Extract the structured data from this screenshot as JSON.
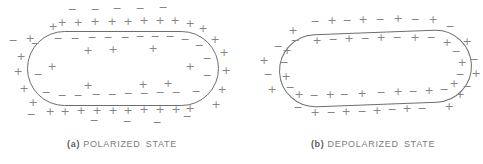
{
  "canvas": {
    "width": 483,
    "height": 164,
    "background": "#ffffff"
  },
  "colors": {
    "membrane": "#6e6e6e",
    "charge": "#858585",
    "caption": "#7c7c7c",
    "caption_prefix": "#5f5f5f"
  },
  "figures": [
    {
      "name": "polarized-cell",
      "caption_prefix": "(a)",
      "caption_text": "POLARIZED STATE",
      "caption_center_x": 122,
      "caption_top": 139,
      "stadium": {
        "left": 27,
        "top": 31,
        "width": 192,
        "height": 75,
        "radius": 37.5,
        "rotate_deg": 0
      },
      "charges": [
        [
          72,
          10,
          "-"
        ],
        [
          95,
          10,
          "-"
        ],
        [
          117,
          9,
          "-"
        ],
        [
          140,
          9,
          "-"
        ],
        [
          163,
          8,
          "-"
        ],
        [
          13,
          41,
          "-"
        ],
        [
          31,
          115,
          "-"
        ],
        [
          94,
          121,
          "-"
        ],
        [
          127,
          122,
          "-"
        ],
        [
          157,
          123,
          "-"
        ],
        [
          187,
          117,
          "-"
        ],
        [
          53,
          27,
          "+"
        ],
        [
          62,
          23,
          "+"
        ],
        [
          78,
          23,
          "+"
        ],
        [
          95,
          22,
          "+"
        ],
        [
          112,
          22,
          "+"
        ],
        [
          128,
          22,
          "+"
        ],
        [
          144,
          21,
          "+"
        ],
        [
          160,
          21,
          "+"
        ],
        [
          175,
          21,
          "+"
        ],
        [
          190,
          24,
          "+"
        ],
        [
          203,
          29,
          "+"
        ],
        [
          215,
          40,
          "+"
        ],
        [
          224,
          53,
          "+"
        ],
        [
          226,
          71,
          "+"
        ],
        [
          222,
          90,
          "+"
        ],
        [
          216,
          105,
          "+"
        ],
        [
          190,
          109,
          "+"
        ],
        [
          176,
          110,
          "+"
        ],
        [
          160,
          110,
          "+"
        ],
        [
          144,
          110,
          "+"
        ],
        [
          128,
          111,
          "+"
        ],
        [
          113,
          111,
          "+"
        ],
        [
          97,
          111,
          "+"
        ],
        [
          81,
          111,
          "+"
        ],
        [
          65,
          112,
          "+"
        ],
        [
          50,
          112,
          "+"
        ],
        [
          33,
          103,
          "+"
        ],
        [
          24,
          89,
          "+"
        ],
        [
          18,
          72,
          "+"
        ],
        [
          21,
          57,
          "+"
        ],
        [
          30,
          39,
          "+"
        ],
        [
          58,
          39,
          "-"
        ],
        [
          75,
          39,
          "-"
        ],
        [
          92,
          38,
          "-"
        ],
        [
          108,
          38,
          "-"
        ],
        [
          125,
          38,
          "-"
        ],
        [
          140,
          37,
          "-"
        ],
        [
          155,
          37,
          "-"
        ],
        [
          170,
          37,
          "-"
        ],
        [
          185,
          40,
          "-"
        ],
        [
          199,
          46,
          "-"
        ],
        [
          207,
          59,
          "-"
        ],
        [
          207,
          76,
          "-"
        ],
        [
          196,
          92,
          "-"
        ],
        [
          176,
          93,
          "-"
        ],
        [
          160,
          93,
          "-"
        ],
        [
          144,
          94,
          "-"
        ],
        [
          128,
          94,
          "-"
        ],
        [
          112,
          95,
          "-"
        ],
        [
          96,
          95,
          "-"
        ],
        [
          78,
          96,
          "-"
        ],
        [
          62,
          96,
          "-"
        ],
        [
          46,
          93,
          "-"
        ],
        [
          38,
          75,
          "-"
        ],
        [
          35,
          44,
          "-"
        ],
        [
          88,
          51,
          "+"
        ],
        [
          113,
          50,
          "+"
        ],
        [
          153,
          49,
          "+"
        ],
        [
          52,
          67,
          "+"
        ],
        [
          190,
          67,
          "+"
        ],
        [
          88,
          86,
          "+"
        ],
        [
          143,
          85,
          "+"
        ],
        [
          168,
          84,
          "+"
        ]
      ]
    },
    {
      "name": "depolarized-cell",
      "caption_prefix": "(b)",
      "caption_text": "DEPOLARIZED STATE",
      "caption_center_x": 373,
      "caption_top": 139,
      "stadium": {
        "left": 279,
        "top": 32,
        "width": 193,
        "height": 73,
        "radius": 36.5,
        "rotate_deg": -2.2
      },
      "charges": [
        [
          293,
          31,
          "+"
        ],
        [
          278,
          47,
          "-"
        ],
        [
          264,
          61,
          "+"
        ],
        [
          268,
          75,
          "-"
        ],
        [
          272,
          90,
          "+"
        ],
        [
          315,
          22,
          "-"
        ],
        [
          332,
          21,
          "+"
        ],
        [
          347,
          21,
          "-"
        ],
        [
          363,
          20,
          "+"
        ],
        [
          380,
          20,
          "-"
        ],
        [
          398,
          19,
          "+"
        ],
        [
          415,
          20,
          "-"
        ],
        [
          433,
          20,
          "+"
        ],
        [
          450,
          27,
          "-"
        ],
        [
          467,
          42,
          "+"
        ],
        [
          474,
          60,
          "-"
        ],
        [
          476,
          74,
          "+"
        ],
        [
          467,
          87,
          "-"
        ],
        [
          460,
          95,
          "+"
        ],
        [
          298,
          108,
          "-"
        ],
        [
          315,
          113,
          "+"
        ],
        [
          331,
          113,
          "-"
        ],
        [
          346,
          112,
          "+"
        ],
        [
          362,
          112,
          "-"
        ],
        [
          377,
          111,
          "+"
        ],
        [
          392,
          110,
          "-"
        ],
        [
          407,
          109,
          "+"
        ],
        [
          422,
          109,
          "-"
        ],
        [
          449,
          107,
          "+"
        ],
        [
          295,
          41,
          "-"
        ],
        [
          317,
          41,
          "+"
        ],
        [
          333,
          40,
          "-"
        ],
        [
          349,
          39,
          "+"
        ],
        [
          365,
          39,
          "-"
        ],
        [
          381,
          38,
          "+"
        ],
        [
          397,
          38,
          "-"
        ],
        [
          415,
          38,
          "+"
        ],
        [
          431,
          38,
          "-"
        ],
        [
          447,
          43,
          "+"
        ],
        [
          456,
          52,
          "-"
        ],
        [
          462,
          63,
          "+"
        ],
        [
          460,
          75,
          "-"
        ],
        [
          454,
          84,
          "+"
        ],
        [
          299,
          95,
          "+"
        ],
        [
          314,
          96,
          "-"
        ],
        [
          330,
          95,
          "+"
        ],
        [
          344,
          95,
          "-"
        ],
        [
          362,
          94,
          "+"
        ],
        [
          381,
          93,
          "-"
        ],
        [
          398,
          92,
          "+"
        ],
        [
          413,
          92,
          "-"
        ],
        [
          429,
          91,
          "+"
        ],
        [
          444,
          90,
          "-"
        ],
        [
          287,
          51,
          "+"
        ],
        [
          284,
          63,
          "-"
        ],
        [
          286,
          77,
          "+"
        ],
        [
          290,
          88,
          "-"
        ]
      ]
    }
  ]
}
